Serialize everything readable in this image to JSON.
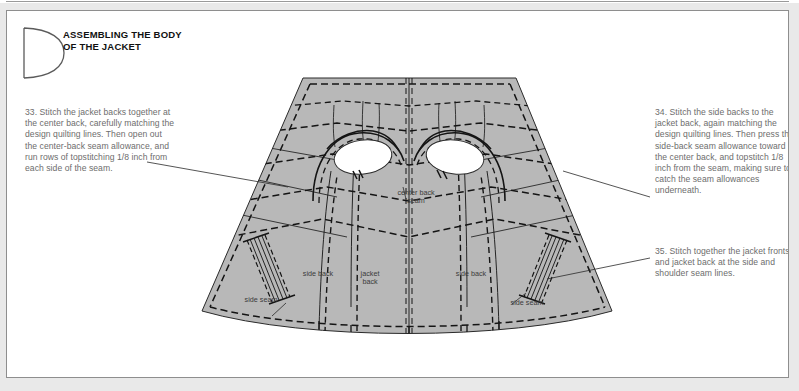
{
  "page": {
    "section_letter": "D",
    "heading_line1": "ASSEMBLING THE BODY",
    "heading_line2": "OF THE JACKET",
    "border_color": "#8e8e8e",
    "page_background": "#ffffff",
    "outer_background": "#e9e9e9"
  },
  "notes": [
    {
      "id": "note-33",
      "number": "33",
      "text": "33. Stitch the jacket backs together at the center back, carefully matching the design quilting lines. Then open out the center-back seam allowance, and run rows of topstitching 1/8 inch from each side of the seam."
    },
    {
      "id": "note-34",
      "number": "34",
      "text": "34. Stitch the side backs to the jacket back, again matching the design quilting lines. Then press the side-back seam allowance toward the center back, and topstitch 1/8 inch from the seam, making sure to catch the seam allowances underneath."
    },
    {
      "id": "note-35",
      "number": "35",
      "text": "35. Stitch together the jacket fronts and jacket back at the side and shoulder seam lines."
    }
  ],
  "diagram": {
    "name": "jacket-back-pattern",
    "fabric_fill": "#b8b8b8",
    "line_color": "#1a1a1a",
    "opening_fill": "#ffffff",
    "labels": {
      "center_back_seam": "center back\nseam",
      "side_back_left": "side back",
      "jacket_back": "jacket\nback",
      "side_back_right": "side back",
      "side_seam_left": "side seam",
      "side_seam_right": "side seam"
    }
  }
}
